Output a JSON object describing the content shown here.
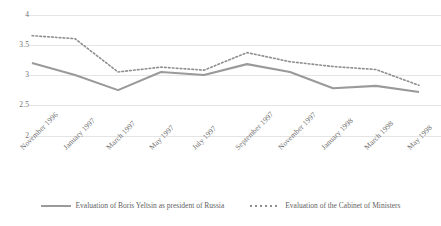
{
  "chart_data": {
    "type": "line",
    "title": "",
    "xlabel": "",
    "ylabel": "",
    "ylim": [
      2,
      4
    ],
    "yticks": [
      "4",
      "3.5",
      "3",
      "2.5",
      "2"
    ],
    "grid": true,
    "legend_position": "bottom",
    "categories": [
      "November 1996",
      "January 1997",
      "March 1997",
      "May 1997",
      "July 1997",
      "September 1997",
      "November 1997",
      "January 1998",
      "March 1998",
      "May 1998"
    ],
    "series": [
      {
        "name": "Evaluation of Boris Yeltsin as president of Russia",
        "style": "solid",
        "color": "#9a9a9a",
        "values": [
          3.2,
          3.0,
          2.75,
          3.05,
          3.0,
          3.18,
          3.05,
          2.78,
          2.82,
          2.72
        ]
      },
      {
        "name": "Evaluation of the Cabinet of Ministers",
        "style": "dotted",
        "color": "#8e8e8e",
        "values": [
          3.65,
          3.6,
          3.05,
          3.13,
          3.08,
          3.37,
          3.22,
          3.14,
          3.09,
          2.83
        ]
      }
    ]
  },
  "legend": {
    "series_1_label": "Evaluation of Boris Yeltsin as president of Russia",
    "series_2_label": "Evaluation of the Cabinet of Ministers"
  },
  "colors": {
    "gridline": "#e4e4e4",
    "tick_text": "#6f6f6f",
    "series_solid": "#9a9a9a",
    "series_dotted": "#8e8e8e",
    "background": "#ffffff"
  }
}
